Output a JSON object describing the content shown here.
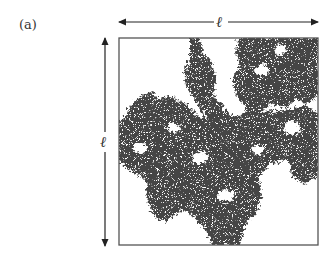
{
  "figure": {
    "panel_label": "(a)",
    "horizontal_dimension_label": "ℓ",
    "vertical_dimension_label": "ℓ",
    "colors": {
      "cluster": "#3a3a3a",
      "box_border": "#555555",
      "arrows": "#222222",
      "background": "#ffffff"
    }
  }
}
